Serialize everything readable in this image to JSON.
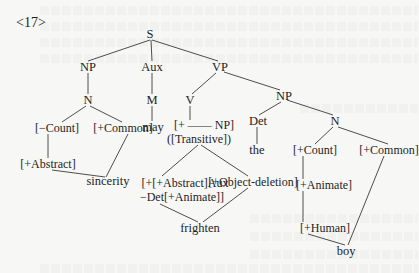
{
  "example_number": "<17>",
  "tree": {
    "root": "S",
    "level1": {
      "np": "NP",
      "aux": "Aux",
      "vp": "VP"
    },
    "level2": {
      "n_subject": "N",
      "m": "M",
      "v": "V"
    },
    "subject_features": {
      "count": "[−Count]",
      "common": "[+Common]",
      "abstract": "[+Abstract]",
      "word": "sincerity"
    },
    "aux_word": "may",
    "verb_features": {
      "frame": "[+ —— NP]",
      "transitive": "([Transitive])",
      "selection_line1": "[+[+Abstract]Aux",
      "selection_line2": "−Det[+Animate]]",
      "object_deletion": "[+Object-deletion]",
      "word": "frighten"
    },
    "object": {
      "np": "NP",
      "det": "Det",
      "det_word": "the",
      "n": "N",
      "count": "[+Count]",
      "common": "[+Common]",
      "animate": "[+Animate]",
      "human": "[+Human]",
      "word": "boy"
    }
  },
  "colors": {
    "background": "#f7f7f5",
    "ink": "#1e1e1e",
    "lines": "#3a3a3a"
  }
}
